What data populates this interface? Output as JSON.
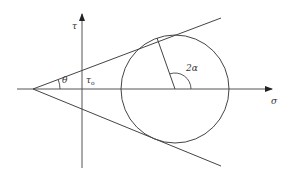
{
  "diagram": {
    "type": "Mohr-Coulomb failure envelope with Mohr circle",
    "colors": {
      "line": "#444444",
      "text": "#333333",
      "background": "#ffffff"
    },
    "axes": {
      "horizontal": {
        "label": "σ",
        "from": [
          17,
          89
        ],
        "to": [
          272,
          89
        ]
      },
      "vertical": {
        "label": "τ",
        "from": [
          82,
          168
        ],
        "to": [
          82,
          14
        ]
      }
    },
    "envelope": {
      "apex": [
        33,
        89
      ],
      "upper_end": [
        221,
        18
      ],
      "lower_end": [
        221,
        166
      ]
    },
    "circle": {
      "center": [
        175,
        89
      ],
      "radius": 54
    },
    "radius_line": {
      "from": [
        175,
        89
      ],
      "to": [
        157,
        38
      ]
    },
    "labels": {
      "tau": "τ",
      "sigma": "σ",
      "theta": "θ",
      "tau0_main": "τ",
      "tau0_sub": "o",
      "two_alpha": "2α"
    }
  }
}
